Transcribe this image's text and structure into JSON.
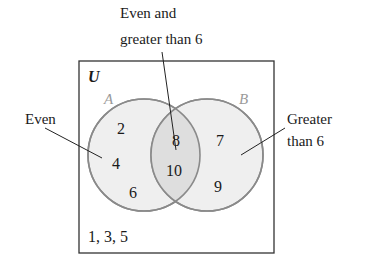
{
  "diagram": {
    "type": "venn",
    "universe_label": "U",
    "outside_elements": "1, 3, 5",
    "sets": [
      {
        "name": "A",
        "description": "Even",
        "only_elements": [
          "2",
          "4",
          "6"
        ]
      },
      {
        "name": "B",
        "description": "Greater than 6",
        "only_elements": [
          "7",
          "9"
        ]
      }
    ],
    "intersection": {
      "description": "Even and greater than 6",
      "elements": [
        "8",
        "10"
      ]
    },
    "callouts": {
      "top_line1": "Even and",
      "top_line2": "greater than 6",
      "left": "Even",
      "right_line1": "Greater",
      "right_line2": "than 6"
    },
    "colors": {
      "circle_fill": "#ececec",
      "overlap_fill": "#dcdcdc",
      "circle_stroke": "#8a8a8a",
      "box_stroke": "#333333"
    }
  }
}
